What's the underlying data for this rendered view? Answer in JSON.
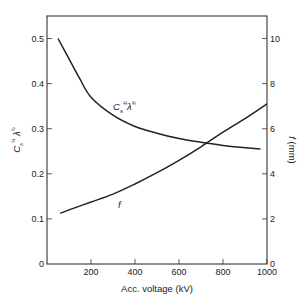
{
  "chart_data": {
    "type": "line",
    "title": "",
    "xlabel": "Acc. voltage (kV)",
    "ylabel_left": "C_s^(1/4) λ^(3/4)",
    "ylabel_right": "f (mm)",
    "xlim": [
      0,
      1000
    ],
    "ylim_left": [
      0,
      0.55
    ],
    "ylim_right": [
      0,
      11
    ],
    "x_ticks": [
      "200",
      "400",
      "600",
      "800",
      "1000"
    ],
    "x_tick_values": [
      200,
      400,
      600,
      800,
      1000
    ],
    "y_left_ticks": [
      "0",
      "0.1",
      "0.2",
      "0.3",
      "0.4",
      "0.5"
    ],
    "y_left_tick_values": [
      0,
      0.1,
      0.2,
      0.3,
      0.4,
      0.5
    ],
    "y_right_ticks": [
      "0",
      "2",
      "4",
      "6",
      "8",
      "10"
    ],
    "y_right_tick_values": [
      0,
      2,
      4,
      6,
      8,
      10
    ],
    "grid": false,
    "series": [
      {
        "name": "Cs^(1/4) λ^(3/4)",
        "axis": "left",
        "label": "C",
        "x": [
          50,
          100,
          150,
          200,
          300,
          400,
          500,
          600,
          700,
          800,
          900,
          970
        ],
        "values": [
          0.5,
          0.455,
          0.41,
          0.37,
          0.33,
          0.305,
          0.29,
          0.278,
          0.27,
          0.263,
          0.258,
          0.255
        ]
      },
      {
        "name": "f",
        "axis": "right",
        "label": "f",
        "x": [
          60,
          100,
          200,
          300,
          400,
          500,
          600,
          700,
          800,
          900,
          1000
        ],
        "values": [
          2.25,
          2.4,
          2.75,
          3.1,
          3.55,
          4.05,
          4.6,
          5.2,
          5.85,
          6.45,
          7.1
        ]
      }
    ]
  }
}
